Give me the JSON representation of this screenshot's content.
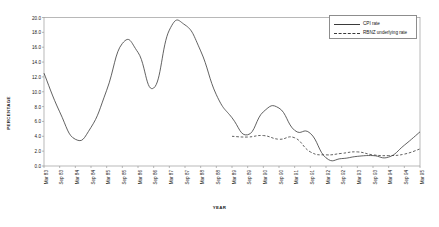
{
  "chart_data": {
    "type": "line",
    "title": "",
    "xlabel": "YEAR",
    "ylabel": "PERCENTAGE",
    "ylim": [
      0.0,
      20.0
    ],
    "yticks": [
      "0.0",
      "2.0",
      "4.0",
      "6.0",
      "8.0",
      "10.0",
      "12.0",
      "14.0",
      "16.0",
      "18.0",
      "20.0"
    ],
    "grid": false,
    "legend_position": "top-right",
    "categories": [
      "Mar 83",
      "Sep 83",
      "Mar 84",
      "Sep 84",
      "Mar 85",
      "Sep 85",
      "Mar 86",
      "Sep 86",
      "Mar 87",
      "Sep 87",
      "Mar 88",
      "Sep 88",
      "Mar 89",
      "Sep 89",
      "Mar 90",
      "Sep 90",
      "Mar 91",
      "Sep 91",
      "Mar 92",
      "Sep 92",
      "Mar 93",
      "Sep 93",
      "Mar 94",
      "Sep 94",
      "Mar 95"
    ],
    "series": [
      {
        "name": "CPI rate",
        "style": "solid",
        "color": "#3a3a3a",
        "values": [
          12.5,
          7.3,
          3.6,
          5.2,
          10.2,
          16.5,
          15.3,
          10.5,
          18.3,
          19.0,
          15.5,
          9.6,
          6.5,
          4.2,
          7.3,
          7.8,
          4.8,
          4.4,
          1.1,
          1.0,
          1.3,
          1.4,
          1.2,
          2.8,
          4.6
        ]
      },
      {
        "name": "RBNZ underlying rate",
        "style": "dashed",
        "color": "#3a3a3a",
        "values": [
          null,
          null,
          null,
          null,
          null,
          null,
          null,
          null,
          null,
          null,
          null,
          null,
          4.0,
          3.9,
          4.1,
          3.6,
          3.8,
          1.9,
          1.5,
          1.7,
          1.9,
          1.5,
          1.4,
          1.6,
          2.3
        ]
      }
    ]
  },
  "legend": {
    "items": [
      {
        "label": "CPI rate"
      },
      {
        "label": "RBNZ underlying rate"
      }
    ]
  }
}
